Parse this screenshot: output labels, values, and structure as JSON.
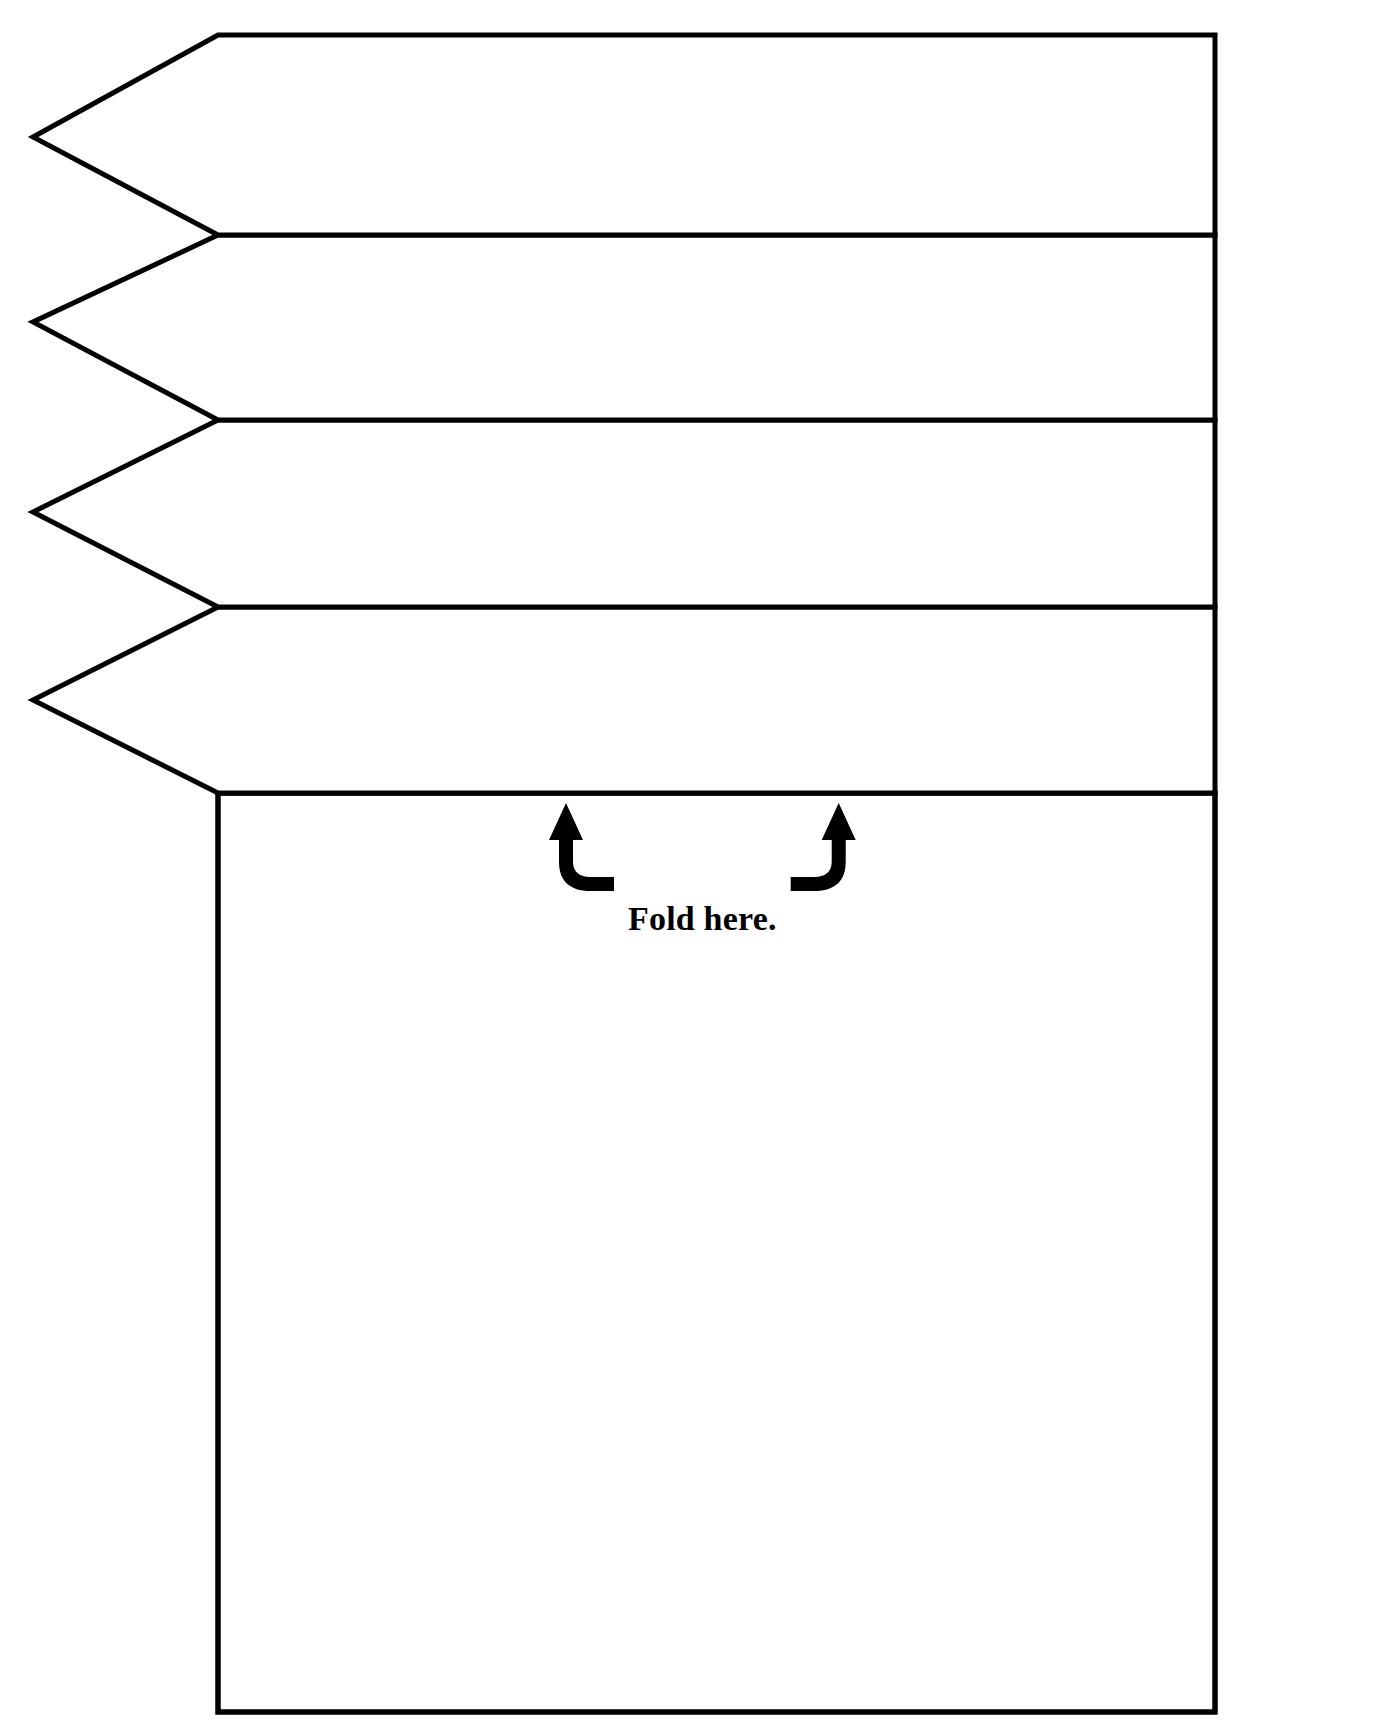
{
  "page": {
    "background_color": "#ffffff",
    "ink_color": "#000000",
    "width": 1378,
    "height": 1736
  },
  "annotations": {
    "fold_label": "Fold here.",
    "fold_label_x": 628,
    "fold_label_y": 930,
    "left_arrow_name": "fold-arrow-left",
    "right_arrow_name": "fold-arrow-right"
  },
  "layout": {
    "tip_x": 33,
    "shoulder_x": 218,
    "right_x": 1215,
    "top_y": 35,
    "bottom_y": 1712,
    "divider_ys": [
      35,
      235,
      420,
      607,
      793
    ],
    "tip_ys": [
      137,
      322,
      512,
      700
    ],
    "base_top_y": 793
  },
  "flaps": [
    {
      "index": 1,
      "name": "flap-band-1",
      "points": "218,35 1215,35 1215,235 218,235 33,137",
      "content": ""
    },
    {
      "index": 2,
      "name": "flap-band-2",
      "points": "218,235 1215,235 1215,420 218,420 33,322",
      "content": ""
    },
    {
      "index": 3,
      "name": "flap-band-3",
      "points": "218,420 1215,420 1215,607 218,607 33,512",
      "content": ""
    },
    {
      "index": 4,
      "name": "flap-band-4",
      "points": "218,607 1215,607 1215,793 218,793 33,700",
      "content": ""
    }
  ],
  "base_panel": {
    "name": "base-answer-panel",
    "points": "218,793 1215,793 1215,1712 218,1712",
    "content": ""
  }
}
